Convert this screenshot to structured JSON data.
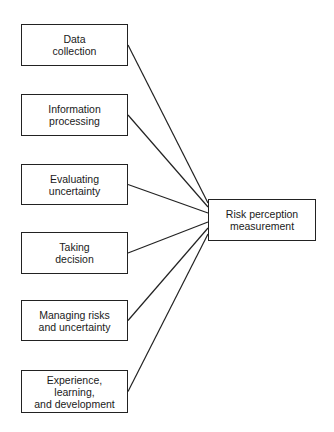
{
  "diagram": {
    "sources": [
      {
        "label": "Data\ncollection",
        "x": 21,
        "y": 24,
        "w": 107,
        "h": 42,
        "ey": 203
      },
      {
        "label": "Information\nprocessing",
        "x": 21,
        "y": 94,
        "w": 107,
        "h": 42,
        "ey": 207
      },
      {
        "label": "Evaluating\nuncertainty",
        "x": 21,
        "y": 164,
        "w": 107,
        "h": 41,
        "ey": 213
      },
      {
        "label": "Taking\ndecision",
        "x": 21,
        "y": 232,
        "w": 107,
        "h": 42,
        "ey": 222
      },
      {
        "label": "Managing risks\nand uncertainty",
        "x": 21,
        "y": 300,
        "w": 107,
        "h": 41,
        "ey": 228
      },
      {
        "label": "Experience,\nlearning,\nand development",
        "x": 21,
        "y": 370,
        "w": 107,
        "h": 43,
        "ey": 234
      }
    ],
    "target": {
      "label": "Risk perception\nmeasurement",
      "x": 208,
      "y": 199,
      "w": 108,
      "h": 42
    },
    "line_color": "#222222"
  }
}
